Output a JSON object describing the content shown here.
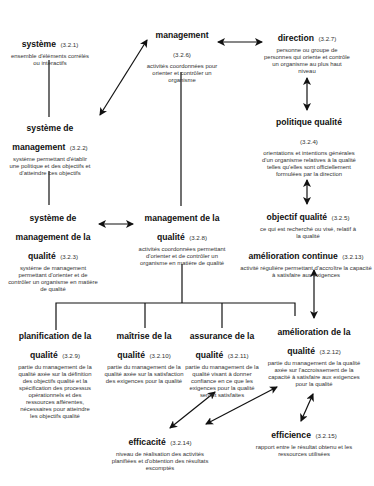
{
  "diagram": {
    "nodes": [
      {
        "id": "systeme",
        "term": "système",
        "ref": "(3.2.1)",
        "definition": "ensemble d'éléments corrélés ou interactifs"
      },
      {
        "id": "management",
        "term": "management",
        "ref": "(3.2.6)",
        "definition": "activités coordonnées pour orienter et contrôler un organisme"
      },
      {
        "id": "direction",
        "term": "direction",
        "ref": "(3.2.7)",
        "definition": "personne ou groupe de personnes qui oriente et contrôle un organisme au plus haut niveau"
      },
      {
        "id": "systeme-de-management",
        "term": "système de management",
        "ref": "(3.2.2)",
        "definition": "système permettant d'établir une politique et des objectifs et d'atteindre ces objectifs"
      },
      {
        "id": "politique-qualite",
        "term": "politique qualité",
        "ref": "(3.2.4)",
        "definition": "orientations et intentions générales d'un organisme relatives à la qualité telles qu'elles sont officiellement formulées par la direction"
      },
      {
        "id": "systeme-de-management-de-la-qualite",
        "term": "système de management de la qualité",
        "ref": "(3.2.3)",
        "definition": "système de management permettant d'orienter et de contrôler un organisme en matière de qualité"
      },
      {
        "id": "management-de-la-qualite",
        "term": "management de la qualité",
        "ref": "(3.2.8)",
        "definition": "activités coordonnées permettant d'orienter et de contrôler un organisme en matière de qualité"
      },
      {
        "id": "objectif-qualite",
        "term": "objectif qualité",
        "ref": "(3.2.5)",
        "definition": "ce qui est recherché ou visé, relatif à la qualité"
      },
      {
        "id": "amelioration-continue",
        "term": "amélioration continue",
        "ref": "(3.2.13)",
        "definition": "activité régulière permettant d'accroître la capacité à satisfaire aux exigences"
      },
      {
        "id": "planification-de-la-qualite",
        "term": "planification de la qualité",
        "ref": "(3.2.9)",
        "definition": "partie du management de la qualité axée sur la définition des objectifs qualité et la spécification des processus opérationnels et des ressources afférentes, nécessaires pour atteindre les objectifs qualité"
      },
      {
        "id": "maitrise-de-la-qualite",
        "term": "maîtrise de la qualité",
        "ref": "(3.2.10)",
        "definition": "partie du management de la qualité axée sur la satisfaction des exigences pour la qualité"
      },
      {
        "id": "assurance-de-la-qualite",
        "term": "assurance de la qualité",
        "ref": "(3.2.11)",
        "definition": "partie du management de la qualité visant à donner confiance en ce que les exigences pour la qualité seront satisfaites"
      },
      {
        "id": "amelioration-de-la-qualite",
        "term": "amélioration de la qualité",
        "ref": "(3.2.12)",
        "definition": "partie du management de la qualité axée sur l'accroissement de la capacité à satisfaire aux exigences pour la qualité"
      },
      {
        "id": "efficacite",
        "term": "efficacité",
        "ref": "(3.2.14)",
        "definition": "niveau de réalisation des activités planifiées et d'obtention des résultats escomptés"
      },
      {
        "id": "efficience",
        "term": "efficience",
        "ref": "(3.2.15)",
        "definition": "rapport entre le résultat obtenu et les ressources utilisées"
      }
    ],
    "connections": [
      {
        "from": "systeme",
        "to": "systeme-de-management",
        "type": "line"
      },
      {
        "from": "management",
        "to": "systeme-de-management",
        "type": "double-arrow"
      },
      {
        "from": "management",
        "to": "direction",
        "type": "double-arrow"
      },
      {
        "from": "direction",
        "to": "politique-qualite",
        "type": "double-arrow"
      },
      {
        "from": "politique-qualite",
        "to": "objectif-qualite",
        "type": "double-arrow"
      },
      {
        "from": "systeme-de-management",
        "to": "systeme-de-management-de-la-qualite",
        "type": "line"
      },
      {
        "from": "management",
        "to": "management-de-la-qualite",
        "type": "line"
      },
      {
        "from": "systeme-de-management-de-la-qualite",
        "to": "management-de-la-qualite",
        "type": "double-arrow"
      },
      {
        "from": "management-de-la-qualite",
        "to": "planification-de-la-qualite",
        "type": "tree"
      },
      {
        "from": "management-de-la-qualite",
        "to": "maitrise-de-la-qualite",
        "type": "tree"
      },
      {
        "from": "management-de-la-qualite",
        "to": "assurance-de-la-qualite",
        "type": "tree"
      },
      {
        "from": "management-de-la-qualite",
        "to": "amelioration-de-la-qualite",
        "type": "tree"
      },
      {
        "from": "amelioration-continue",
        "to": "amelioration-de-la-qualite",
        "type": "double-arrow"
      },
      {
        "from": "assurance-de-la-qualite",
        "to": "efficacite",
        "type": "double-arrow"
      },
      {
        "from": "amelioration-de-la-qualite",
        "to": "efficacite",
        "type": "double-arrow"
      },
      {
        "from": "amelioration-de-la-qualite",
        "to": "efficience",
        "type": "double-arrow"
      }
    ]
  }
}
